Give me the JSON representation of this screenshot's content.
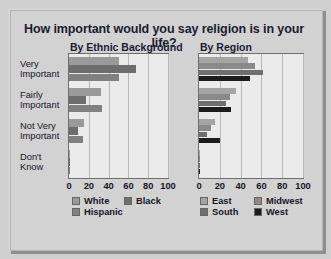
{
  "title": "How important would you say religion is in your life?",
  "panels": [
    {
      "id": "ethnic",
      "heading": "By Ethnic Background"
    },
    {
      "id": "region",
      "heading": "By Region"
    }
  ],
  "categories": [
    "Very\nImportant",
    "Fairly\nImportant",
    "Not Very\nImportant",
    "Don't\nKnow"
  ],
  "category_lines": [
    [
      "Very",
      "Important"
    ],
    [
      "Fairly",
      "Important"
    ],
    [
      "Not Very",
      "Important"
    ],
    [
      "Don't",
      "Know"
    ]
  ],
  "xticks": [
    "0",
    "20",
    "40",
    "60",
    "80",
    "100"
  ],
  "legend_ethnic": [
    {
      "label": "White",
      "color": "#9a9a9a"
    },
    {
      "label": "Black",
      "color": "#6d6d6d"
    },
    {
      "label": "Hispanic",
      "color": "#808080"
    }
  ],
  "legend_region": [
    {
      "label": "East",
      "color": "#a5a5a5"
    },
    {
      "label": "Midwest",
      "color": "#8a8a8a"
    },
    {
      "label": "South",
      "color": "#6f6f6f"
    },
    {
      "label": "West",
      "color": "#1c1c1c"
    }
  ],
  "chart_data": [
    {
      "type": "bar",
      "orientation": "horizontal",
      "title": "By Ethnic Background",
      "subtitle": "How important would you say religion is in your life?",
      "xlabel": "",
      "ylabel": "",
      "xlim": [
        0,
        100
      ],
      "xticks": [
        0,
        20,
        40,
        60,
        80,
        100
      ],
      "grid": true,
      "legend_position": "bottom",
      "categories": [
        "Very Important",
        "Fairly Important",
        "Not Very Important",
        "Don't Know"
      ],
      "series": [
        {
          "name": "White",
          "color": "#9a9a9a",
          "values": [
            50,
            32,
            15,
            1
          ]
        },
        {
          "name": "Black",
          "color": "#6d6d6d",
          "values": [
            68,
            17,
            9,
            1
          ]
        },
        {
          "name": "Hispanic",
          "color": "#808080",
          "values": [
            50,
            33,
            14,
            1
          ]
        }
      ]
    },
    {
      "type": "bar",
      "orientation": "horizontal",
      "title": "By Region",
      "subtitle": "How important would you say religion is in your life?",
      "xlabel": "",
      "ylabel": "",
      "xlim": [
        0,
        100
      ],
      "xticks": [
        0,
        20,
        40,
        60,
        80,
        100
      ],
      "grid": true,
      "legend_position": "bottom",
      "categories": [
        "Very Important",
        "Fairly Important",
        "Not Very Important",
        "Don't Know"
      ],
      "series": [
        {
          "name": "East",
          "color": "#a5a5a5",
          "values": [
            47,
            36,
            15,
            1
          ]
        },
        {
          "name": "Midwest",
          "color": "#8a8a8a",
          "values": [
            54,
            30,
            12,
            1
          ]
        },
        {
          "name": "South",
          "color": "#6f6f6f",
          "values": [
            62,
            26,
            8,
            1
          ]
        },
        {
          "name": "West",
          "color": "#1c1c1c",
          "values": [
            49,
            31,
            20,
            1
          ]
        }
      ]
    }
  ]
}
